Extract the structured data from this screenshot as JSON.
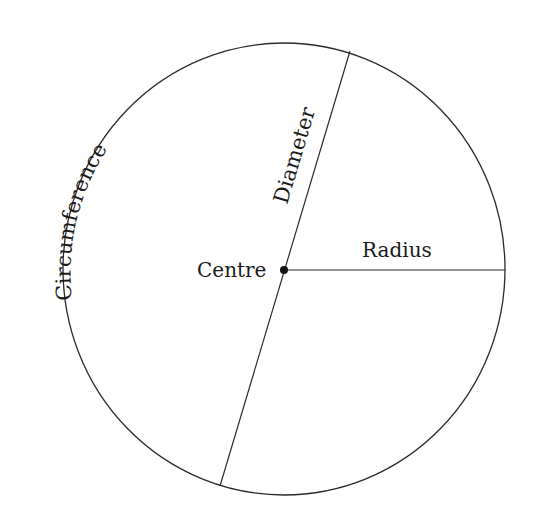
{
  "diagram": {
    "labels": {
      "circumference": "Circumference",
      "diameter": "Diameter",
      "centre": "Centre",
      "radius": "Radius"
    },
    "colors": {
      "stroke": "#2a2a2a",
      "text": "#1a1a1a",
      "background": "#ffffff"
    }
  }
}
